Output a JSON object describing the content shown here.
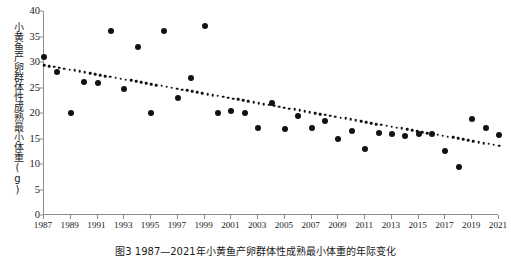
{
  "chart_data": {
    "type": "scatter",
    "title": "",
    "xlabel": "",
    "ylabel": "小黄鱼产卵群体性成熟最小体重(g)",
    "caption": "图3 1987—2021年小黄鱼产卵群体性成熟最小体重的年际变化",
    "xlim": [
      1987,
      2021
    ],
    "ylim": [
      0,
      40
    ],
    "yticks": [
      0,
      5,
      10,
      15,
      20,
      25,
      30,
      35,
      40
    ],
    "xticks": [
      1987,
      1989,
      1991,
      1993,
      1995,
      1997,
      1999,
      2001,
      2003,
      2005,
      2007,
      2009,
      2011,
      2013,
      2015,
      2017,
      2019,
      2021
    ],
    "grid": false,
    "legend": null,
    "marker": "filled-circle",
    "marker_color": "#111111",
    "axis_color": "#8c8c8c",
    "series": [
      {
        "name": "性成熟最小体重",
        "x": [
          1987,
          1988,
          1989,
          1990,
          1991,
          1992,
          1993,
          1994,
          1995,
          1996,
          1997,
          1998,
          1999,
          2000,
          2001,
          2002,
          2003,
          2004,
          2005,
          2006,
          2007,
          2008,
          2009,
          2010,
          2011,
          2012,
          2013,
          2014,
          2015,
          2016,
          2017,
          2018,
          2019,
          2020,
          2021
        ],
        "values": [
          31.0,
          28.0,
          20.0,
          26.0,
          25.8,
          36.0,
          24.8,
          33.0,
          20.0,
          36.0,
          23.0,
          26.8,
          37.0,
          20.0,
          20.3,
          20.0,
          17.0,
          22.0,
          16.8,
          19.5,
          17.0,
          18.5,
          15.0,
          16.5,
          13.0,
          16.0,
          15.8,
          15.5,
          15.8,
          15.8,
          12.5,
          9.5,
          18.8,
          17.0,
          15.7
        ]
      }
    ],
    "trendline": {
      "type": "linear-dotted",
      "style": "dotted",
      "x_start": 1987,
      "x_end": 2021,
      "y_start": 29.4,
      "y_end": 13.6
    }
  }
}
